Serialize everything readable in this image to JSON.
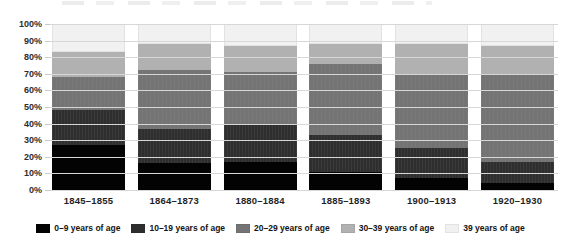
{
  "chart_data": {
    "type": "bar",
    "variant": "stacked-percent",
    "title": "",
    "categories": [
      "1845–1855",
      "1864–1873",
      "1880–1884",
      "1885–1893",
      "1900–1913",
      "1920–1930"
    ],
    "series": [
      {
        "name": "0–9 years of age",
        "color": "#030303",
        "values": [
          27,
          16,
          17,
          11,
          7,
          4
        ]
      },
      {
        "name": "10–19 years of age",
        "color": "#2e2e2e",
        "values": [
          21,
          21,
          22,
          22,
          18,
          13
        ]
      },
      {
        "name": "20–29 years of age",
        "color": "#747474",
        "values": [
          20,
          35,
          32,
          43,
          45,
          52
        ]
      },
      {
        "name": "30–39 years of age",
        "color": "#b1b1b1",
        "values": [
          15,
          16,
          16,
          12,
          18,
          18
        ]
      },
      {
        "name": "39 years of age",
        "color": "#f1f1f1",
        "values": [
          17,
          12,
          13,
          12,
          12,
          13
        ]
      }
    ],
    "y_ticks": [
      "100%",
      "90%",
      "80%",
      "70%",
      "60%",
      "50%",
      "40%",
      "30%",
      "20%",
      "10%",
      "0%"
    ],
    "ylim": [
      0,
      100
    ],
    "grid": true,
    "gridline_color": "#d7d7d7",
    "legend_position": "bottom",
    "background_color": "#ffffff"
  }
}
